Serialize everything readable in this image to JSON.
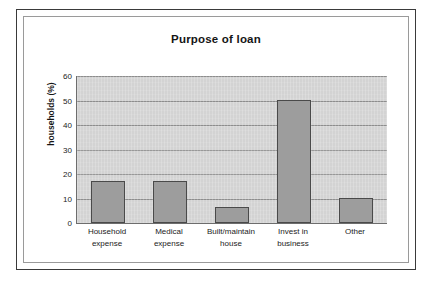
{
  "figure": {
    "border_color": "#3a3a3a",
    "inner_border_color": "#9a9a9a",
    "background": "#ffffff"
  },
  "chart_data": {
    "type": "bar",
    "title": "Purpose of loan",
    "xlabel": "",
    "ylabel": "households (%)",
    "categories": [
      "Household expense",
      "Medical expense",
      "Built/maintain house",
      "Invest in business",
      "Other"
    ],
    "category_lines": [
      [
        "Household",
        "expense"
      ],
      [
        "Medical",
        "expense"
      ],
      [
        "Built/maintain",
        "house"
      ],
      [
        "Invest in",
        "business"
      ],
      [
        "Other"
      ]
    ],
    "values": [
      17,
      17,
      6.7,
      50,
      10
    ],
    "ylim": [
      0,
      60
    ],
    "ytick_step": 10,
    "yticks": [
      0,
      10,
      20,
      30,
      40,
      50,
      60
    ],
    "ytick_labels": [
      "0",
      "10",
      "20",
      "30",
      "40",
      "50",
      "60"
    ],
    "grid": true,
    "grid_axis": "y",
    "legend": false,
    "legend_position": "none",
    "plot_background": "#d3d3d3",
    "bar_color": "#9d9d9d",
    "bar_edge_color": "#4a4a4a",
    "gridline_color": "#8d8d8d",
    "axis_color": "#6d6d6d"
  }
}
